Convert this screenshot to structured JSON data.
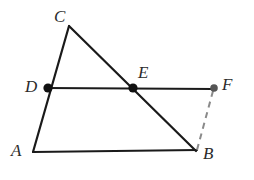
{
  "figure": {
    "canvas": {
      "width": 254,
      "height": 180,
      "background": "#ffffff"
    },
    "style": {
      "solid_stroke": "#1a1a1a",
      "solid_width": 2.2,
      "dashed_stroke": "#8a8a8a",
      "dashed_width": 2.0,
      "dash_pattern": "6 5",
      "point_fill": "#111111",
      "point_fill_light": "#555555",
      "label_color": "#2b2b2b"
    },
    "points": [
      {
        "id": "C",
        "label": "C",
        "x": 69,
        "y": 26,
        "marker": false,
        "label_x": 54,
        "label_y": 8
      },
      {
        "id": "D",
        "label": "D",
        "x": 48,
        "y": 88,
        "marker": true,
        "label_x": 25,
        "label_y": 78
      },
      {
        "id": "E",
        "label": "E",
        "x": 133,
        "y": 88,
        "marker": true,
        "label_x": 138,
        "label_y": 64
      },
      {
        "id": "F",
        "label": "F",
        "x": 214,
        "y": 88,
        "marker": true,
        "label_x": 222,
        "label_y": 76
      },
      {
        "id": "A",
        "label": "A",
        "x": 33,
        "y": 152,
        "marker": false,
        "label_x": 11,
        "label_y": 142
      },
      {
        "id": "B",
        "label": "B",
        "x": 196,
        "y": 151,
        "marker": false,
        "label_x": 203,
        "label_y": 145
      }
    ],
    "segments": [
      {
        "id": "CA",
        "from": "C",
        "to": "A",
        "x1": 69,
        "y1": 26,
        "x2": 33,
        "y2": 152,
        "style": "solid"
      },
      {
        "id": "CB",
        "from": "C",
        "to": "B",
        "x1": 69,
        "y1": 26,
        "x2": 196,
        "y2": 151,
        "style": "solid"
      },
      {
        "id": "DF",
        "from": "D",
        "to": "F",
        "x1": 46,
        "y1": 88,
        "x2": 214,
        "y2": 89,
        "style": "solid"
      },
      {
        "id": "AB",
        "from": "A",
        "to": "B",
        "x1": 33,
        "y1": 152,
        "x2": 197,
        "y2": 150,
        "style": "solid"
      },
      {
        "id": "FB",
        "from": "F",
        "to": "B",
        "x1": 213,
        "y1": 91,
        "x2": 197,
        "y2": 150,
        "style": "dashed"
      }
    ]
  }
}
